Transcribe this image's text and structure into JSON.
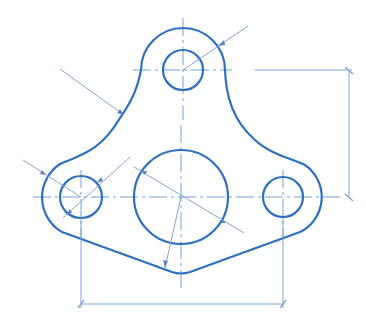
{
  "drawing": {
    "type": "mechanical part drawing (bracket with three holes)",
    "colors": {
      "outline": "#2f6fbf",
      "center_lines": "#6fa3dc",
      "dimension_lines": "#7fa6d6",
      "leaders": "#8aa6cc",
      "background": "#ffffff"
    },
    "features": {
      "top_hole": {
        "cx": 183,
        "cy": 70,
        "r": 20
      },
      "top_boss_arc": {
        "cx": 183,
        "cy": 70,
        "r": 42
      },
      "center_hole": {
        "cx": 181,
        "cy": 197,
        "r": 47
      },
      "left_hole": {
        "cx": 81,
        "cy": 197,
        "r": 21
      },
      "left_boss_arc": {
        "cx": 81,
        "cy": 197,
        "r": 40
      },
      "right_hole": {
        "cx": 283,
        "cy": 197,
        "r": 20
      },
      "right_boss_arc": {
        "cx": 283,
        "cy": 197,
        "r": 39
      }
    },
    "dimensions": [
      {
        "name": "vertical-spacing",
        "from": [
          349,
          70
        ],
        "to": [
          349,
          197
        ],
        "label": ""
      },
      {
        "name": "horizontal-spacing",
        "from": [
          81,
          304
        ],
        "to": [
          283,
          304
        ],
        "label": ""
      }
    ],
    "labels": []
  }
}
